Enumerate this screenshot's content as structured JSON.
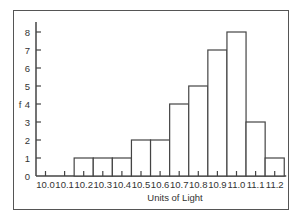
{
  "chart_data": {
    "type": "bar",
    "title": "",
    "xlabel": "Units of Light",
    "ylabel": "f",
    "categories": [
      "10.0",
      "10.1",
      "10.2",
      "10.3",
      "10.4",
      "10.5",
      "10.6",
      "10.7",
      "10.8",
      "10.9",
      "11.0",
      "11.1",
      "11.2"
    ],
    "values": [
      0,
      0,
      1,
      1,
      1,
      2,
      2,
      4,
      5,
      7,
      8,
      3,
      1
    ],
    "ylim": [
      0,
      8
    ],
    "yticks": [
      0,
      1,
      2,
      3,
      4,
      5,
      6,
      7,
      8
    ],
    "grid": false,
    "legend": null
  }
}
